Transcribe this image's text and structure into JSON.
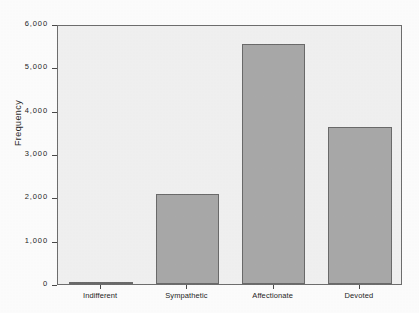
{
  "chart_data": {
    "type": "bar",
    "title": "",
    "subtitle": "",
    "xlabel": "",
    "ylabel": "Frequency",
    "categories": [
      "Indifferent",
      "Sympathetic",
      "Affectionate",
      "Devoted"
    ],
    "values": [
      40,
      2080,
      5530,
      3620
    ],
    "series": [
      {
        "name": "Frequency",
        "values": [
          40,
          2080,
          5530,
          3620
        ]
      }
    ],
    "ylim": [
      0,
      6000
    ],
    "yticks": [
      0,
      1000,
      2000,
      3000,
      4000,
      5000,
      6000
    ],
    "ytick_labels": [
      "0",
      "1,000",
      "2,000",
      "3,000",
      "4,000",
      "5,000",
      "6,000"
    ],
    "grid": false,
    "legend": false,
    "legend_position": "none",
    "bar_color": "#a9a9a9",
    "bar_edge_color": "#6b6b6b",
    "plot_background": "#f1f1f1",
    "frame_color": "#6e6e6e",
    "axis_text_color": "#1f1f1f"
  }
}
